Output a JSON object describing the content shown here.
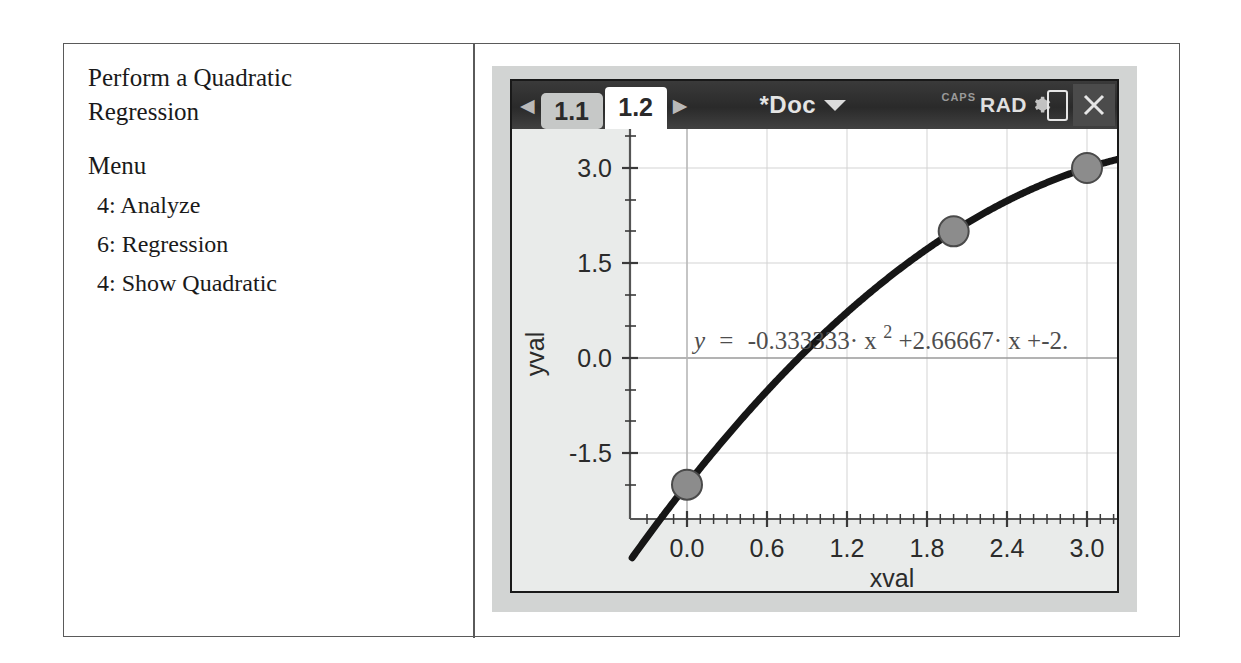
{
  "instructions": {
    "title": "Perform a Quadratic Regression",
    "menu_heading": "Menu",
    "steps": [
      "4: Analyze",
      "6: Regression",
      "4: Show Quadratic"
    ]
  },
  "calculator": {
    "status_bar": {
      "prev_arrow": "◀",
      "next_arrow": "▶",
      "tabs": [
        {
          "label": "1.1",
          "active": false
        },
        {
          "label": "1.2",
          "active": true
        }
      ],
      "document_title": "*Doc",
      "caps_indicator": "CAPS",
      "angle_mode": "RAD",
      "close_label": "✕"
    }
  },
  "chart_data": {
    "type": "scatter",
    "title": "",
    "xlabel": "xval",
    "ylabel": "yval",
    "xlim": [
      -0.45,
      3.42
    ],
    "ylim": [
      -2.55,
      3.55
    ],
    "xticks": [
      "0.0",
      "0.6",
      "1.2",
      "1.8",
      "2.4",
      "3.0"
    ],
    "xtick_values": [
      0.0,
      0.6,
      1.2,
      1.8,
      2.4,
      3.0
    ],
    "yticks": [
      "3.0",
      "1.5",
      "0.0",
      "-1.5"
    ],
    "ytick_values": [
      3.0,
      1.5,
      0.0,
      -1.5
    ],
    "grid": true,
    "points": [
      {
        "x": 0.0,
        "y": -2.0
      },
      {
        "x": 2.0,
        "y": 2.0
      },
      {
        "x": 3.0,
        "y": 3.0
      }
    ],
    "series": [
      {
        "name": "quadratic regression",
        "type": "line",
        "equation_label": "y = -0.333333· x 2 +2.66667· x+-2.",
        "coefficients": {
          "a": -0.333333,
          "b": 2.66667,
          "c": -2.0
        }
      }
    ],
    "equation": {
      "lhs": "y",
      "equals": "=",
      "a_term": "-0.333333· x",
      "a_exponent": "2",
      "b_term": "+2.66667· x",
      "c_term": "+-2.",
      "full": "y = -0.333333·x²+2.66667·x+-2."
    }
  }
}
